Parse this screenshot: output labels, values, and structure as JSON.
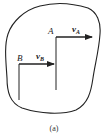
{
  "figure": {
    "caption": "(a)",
    "body_outline": "rigid-body",
    "points": [
      {
        "name": "A",
        "label": "A",
        "velocity_label": "v",
        "velocity_sub": "A"
      },
      {
        "name": "B",
        "label": "B",
        "velocity_label": "v",
        "velocity_sub": "B"
      }
    ],
    "colors": {
      "stroke": "#222222",
      "background": "#ffffff"
    }
  }
}
